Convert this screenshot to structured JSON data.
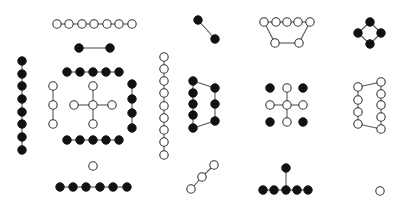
{
  "diagram": {
    "title": "",
    "width": 402,
    "height": 207,
    "background": "#ffffff",
    "node_radius": 4.2,
    "colors": {
      "edge": "#555555",
      "open_stroke": "#333333",
      "filled": "#111111"
    },
    "graphs": [
      {
        "id": "path-7-open-top",
        "nodes": [
          [
            57,
            24,
            "open"
          ],
          [
            69,
            24,
            "open"
          ],
          [
            82,
            24,
            "open"
          ],
          [
            94,
            24,
            "open"
          ],
          [
            107,
            24,
            "open"
          ],
          [
            119,
            24,
            "open"
          ],
          [
            132,
            24,
            "open"
          ]
        ],
        "edges": [
          [
            0,
            1
          ],
          [
            1,
            2
          ],
          [
            2,
            3
          ],
          [
            3,
            4
          ],
          [
            4,
            5
          ],
          [
            5,
            6
          ]
        ]
      },
      {
        "id": "edge-2-filled",
        "nodes": [
          [
            79,
            48,
            "filled"
          ],
          [
            110,
            48,
            "filled"
          ]
        ],
        "edges": [
          [
            0,
            1
          ]
        ]
      },
      {
        "id": "path-8-filled-vertical-left",
        "nodes": [
          [
            22,
            61,
            "filled"
          ],
          [
            22,
            74,
            "filled"
          ],
          [
            22,
            86,
            "filled"
          ],
          [
            22,
            99,
            "filled"
          ],
          [
            22,
            112,
            "filled"
          ],
          [
            22,
            124,
            "filled"
          ],
          [
            22,
            137,
            "filled"
          ],
          [
            22,
            150,
            "filled"
          ]
        ],
        "edges": [
          [
            0,
            1
          ],
          [
            1,
            2
          ],
          [
            2,
            3
          ],
          [
            3,
            4
          ],
          [
            4,
            5
          ],
          [
            5,
            6
          ],
          [
            6,
            7
          ]
        ]
      },
      {
        "id": "path-5-filled-top-row",
        "nodes": [
          [
            67,
            72,
            "filled"
          ],
          [
            80,
            72,
            "filled"
          ],
          [
            93,
            72,
            "filled"
          ],
          [
            106,
            72,
            "filled"
          ],
          [
            119,
            72,
            "filled"
          ]
        ],
        "edges": [
          [
            0,
            1
          ],
          [
            1,
            2
          ],
          [
            2,
            3
          ],
          [
            3,
            4
          ]
        ]
      },
      {
        "id": "path-3-open-vertical",
        "nodes": [
          [
            53,
            86,
            "open"
          ],
          [
            53,
            105,
            "open"
          ],
          [
            53,
            124,
            "open"
          ]
        ],
        "edges": [
          [
            0,
            1
          ],
          [
            1,
            2
          ]
        ]
      },
      {
        "id": "star-5-open-cross",
        "nodes": [
          [
            93,
            105,
            "open"
          ],
          [
            93,
            86,
            "open"
          ],
          [
            74,
            105,
            "open"
          ],
          [
            112,
            105,
            "open"
          ],
          [
            93,
            124,
            "open"
          ]
        ],
        "edges": [
          [
            0,
            1
          ],
          [
            0,
            2
          ],
          [
            0,
            3
          ],
          [
            0,
            4
          ]
        ]
      },
      {
        "id": "path-4-filled-vertical-right",
        "nodes": [
          [
            132,
            84,
            "filled"
          ],
          [
            132,
            99,
            "filled"
          ],
          [
            132,
            113,
            "filled"
          ],
          [
            132,
            128,
            "filled"
          ]
        ],
        "edges": [
          [
            0,
            1
          ],
          [
            1,
            2
          ],
          [
            2,
            3
          ]
        ]
      },
      {
        "id": "path-5-filled-bottom-row",
        "nodes": [
          [
            67,
            140,
            "filled"
          ],
          [
            80,
            140,
            "filled"
          ],
          [
            93,
            140,
            "filled"
          ],
          [
            106,
            140,
            "filled"
          ],
          [
            119,
            140,
            "filled"
          ]
        ],
        "edges": [
          [
            0,
            1
          ],
          [
            1,
            2
          ],
          [
            2,
            3
          ],
          [
            3,
            4
          ]
        ]
      },
      {
        "id": "path-9-open-vertical",
        "nodes": [
          [
            164,
            57,
            "open"
          ],
          [
            164,
            69,
            "open"
          ],
          [
            164,
            81,
            "open"
          ],
          [
            164,
            93,
            "open"
          ],
          [
            164,
            106,
            "open"
          ],
          [
            164,
            118,
            "open"
          ],
          [
            164,
            130,
            "open"
          ],
          [
            164,
            142,
            "open"
          ],
          [
            164,
            155,
            "open"
          ]
        ],
        "edges": [
          [
            0,
            1
          ],
          [
            1,
            2
          ],
          [
            2,
            3
          ],
          [
            3,
            4
          ],
          [
            4,
            5
          ],
          [
            5,
            6
          ],
          [
            6,
            7
          ],
          [
            7,
            8
          ]
        ]
      },
      {
        "id": "isolated-open",
        "nodes": [
          [
            93,
            166,
            "open"
          ]
        ],
        "edges": []
      },
      {
        "id": "path-6-filled-bottom",
        "nodes": [
          [
            60,
            187,
            "filled"
          ],
          [
            73,
            187,
            "filled"
          ],
          [
            86,
            187,
            "filled"
          ],
          [
            100,
            187,
            "filled"
          ],
          [
            113,
            187,
            "filled"
          ],
          [
            127,
            187,
            "filled"
          ]
        ],
        "edges": [
          [
            0,
            1
          ],
          [
            1,
            2
          ],
          [
            2,
            3
          ],
          [
            3,
            4
          ],
          [
            4,
            5
          ]
        ]
      },
      {
        "id": "edge-2-filled-diagonal",
        "nodes": [
          [
            198,
            20,
            "filled"
          ],
          [
            215,
            39,
            "filled"
          ]
        ],
        "edges": [
          [
            0,
            1
          ]
        ]
      },
      {
        "id": "cycle-7-open-trapezoid",
        "nodes": [
          [
            264,
            22,
            "open"
          ],
          [
            276,
            22,
            "open"
          ],
          [
            287,
            22,
            "open"
          ],
          [
            298,
            22,
            "open"
          ],
          [
            310,
            22,
            "open"
          ],
          [
            299,
            43,
            "open"
          ],
          [
            275,
            43,
            "open"
          ]
        ],
        "edges": [
          [
            0,
            1
          ],
          [
            1,
            2
          ],
          [
            2,
            3
          ],
          [
            3,
            4
          ],
          [
            4,
            5
          ],
          [
            5,
            6
          ],
          [
            6,
            0
          ]
        ]
      },
      {
        "id": "cycle-4-filled-diamond",
        "nodes": [
          [
            370,
            22,
            "filled"
          ],
          [
            381,
            33,
            "filled"
          ],
          [
            370,
            44,
            "filled"
          ],
          [
            358,
            33,
            "filled"
          ]
        ],
        "edges": [
          [
            0,
            1
          ],
          [
            1,
            2
          ],
          [
            2,
            3
          ],
          [
            3,
            0
          ]
        ]
      },
      {
        "id": "cycle-8-filled",
        "nodes": [
          [
            193,
            81,
            "filled"
          ],
          [
            193,
            93,
            "filled"
          ],
          [
            193,
            104,
            "filled"
          ],
          [
            193,
            115,
            "filled"
          ],
          [
            193,
            128,
            "filled"
          ],
          [
            215,
            121,
            "filled"
          ],
          [
            215,
            104,
            "filled"
          ],
          [
            215,
            88,
            "filled"
          ]
        ],
        "edges": [
          [
            0,
            1
          ],
          [
            1,
            2
          ],
          [
            2,
            3
          ],
          [
            3,
            4
          ],
          [
            4,
            5
          ],
          [
            5,
            6
          ],
          [
            6,
            7
          ],
          [
            7,
            0
          ]
        ]
      },
      {
        "id": "cross-open-with-filled-corners",
        "nodes": [
          [
            287,
            105,
            "open"
          ],
          [
            287,
            88,
            "open"
          ],
          [
            270,
            105,
            "open"
          ],
          [
            303,
            105,
            "open"
          ],
          [
            287,
            122,
            "open"
          ],
          [
            270,
            88,
            "filled"
          ],
          [
            303,
            88,
            "filled"
          ],
          [
            270,
            122,
            "filled"
          ],
          [
            303,
            122,
            "filled"
          ]
        ],
        "edges": [
          [
            0,
            1
          ],
          [
            0,
            2
          ],
          [
            0,
            3
          ],
          [
            0,
            4
          ]
        ]
      },
      {
        "id": "cycle-9-open",
        "nodes": [
          [
            358,
            87,
            "open"
          ],
          [
            358,
            100,
            "open"
          ],
          [
            358,
            112,
            "open"
          ],
          [
            358,
            124,
            "open"
          ],
          [
            381,
            129,
            "open"
          ],
          [
            381,
            117,
            "open"
          ],
          [
            381,
            105,
            "open"
          ],
          [
            381,
            94,
            "open"
          ],
          [
            381,
            82,
            "open"
          ]
        ],
        "edges": [
          [
            0,
            1
          ],
          [
            1,
            2
          ],
          [
            2,
            3
          ],
          [
            3,
            4
          ],
          [
            4,
            5
          ],
          [
            5,
            6
          ],
          [
            6,
            7
          ],
          [
            7,
            8
          ],
          [
            8,
            0
          ]
        ]
      },
      {
        "id": "path-3-open-diagonal",
        "nodes": [
          [
            191,
            189,
            "open"
          ],
          [
            202,
            177,
            "open"
          ],
          [
            214,
            165,
            "open"
          ]
        ],
        "edges": [
          [
            0,
            1
          ],
          [
            1,
            2
          ]
        ]
      },
      {
        "id": "tree-6-filled-t",
        "nodes": [
          [
            263,
            190,
            "filled"
          ],
          [
            274,
            190,
            "filled"
          ],
          [
            286,
            190,
            "filled"
          ],
          [
            297,
            190,
            "filled"
          ],
          [
            308,
            190,
            "filled"
          ],
          [
            286,
            168,
            "filled"
          ]
        ],
        "edges": [
          [
            0,
            1
          ],
          [
            1,
            2
          ],
          [
            2,
            3
          ],
          [
            3,
            4
          ],
          [
            2,
            5
          ]
        ]
      },
      {
        "id": "isolated-open-right",
        "nodes": [
          [
            380,
            191,
            "open"
          ]
        ],
        "edges": []
      }
    ]
  }
}
